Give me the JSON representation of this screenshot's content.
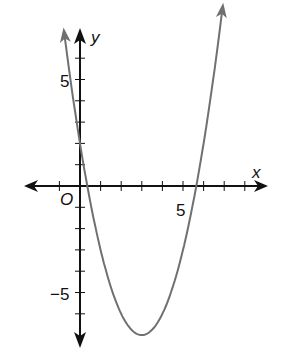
{
  "chart_data": {
    "type": "line",
    "title": "",
    "xlabel": "x",
    "ylabel": "y",
    "origin_label": "O",
    "function": "y = x^2 - 6x + 2",
    "tick_labels": {
      "x": [
        "5"
      ],
      "y": [
        "5",
        "−5"
      ]
    },
    "x_ticks": [
      -1,
      1,
      2,
      3,
      4,
      5,
      6,
      7,
      8
    ],
    "y_ticks": [
      6,
      5,
      4,
      3,
      2,
      1,
      -1,
      -2,
      -3,
      -4,
      -5,
      -6
    ],
    "xlim": [
      -2.7,
      9.1
    ],
    "ylim": [
      -7.9,
      7.4
    ],
    "grid": false,
    "series": [
      {
        "name": "parabola",
        "x": [
          -0.8,
          -0.5,
          0,
          0.35,
          1,
          2,
          3,
          4,
          5,
          5.65,
          6.5,
          7.0
        ],
        "values": [
          7.44,
          5.25,
          2,
          0,
          -3,
          -6,
          -7,
          -6,
          -3,
          0,
          5.25,
          9.0
        ]
      }
    ],
    "roots": [
      0.35,
      5.65
    ],
    "vertex": [
      3,
      -7
    ],
    "y_intercept": 2
  },
  "colors": {
    "axis": "#111111",
    "curve": "#707070"
  }
}
